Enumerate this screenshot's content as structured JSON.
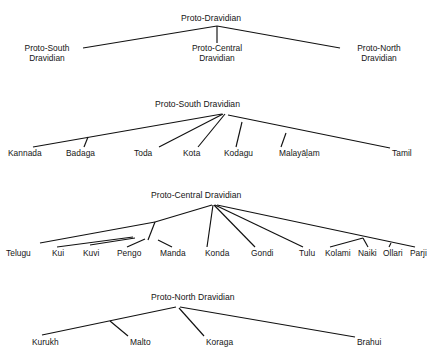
{
  "figure": {
    "background_color": "#ffffff",
    "line_color": "#111111",
    "text_color": "#151515",
    "caption_fragment": ""
  },
  "trees": [
    {
      "id": "proto-dravidian",
      "root": "Proto-Dravidian",
      "children": [
        {
          "label_line1": "Proto-South",
          "label_line2": "Dravidian"
        },
        {
          "label_line1": "Proto-Central",
          "label_line2": "Dravidian"
        },
        {
          "label_line1": "Proto-North",
          "label_line2": "Dravidian"
        }
      ]
    },
    {
      "id": "proto-south-dravidian",
      "root": "Proto-South Dravidian",
      "children": [
        {
          "label": "Kannada"
        },
        {
          "label": "Badaga"
        },
        {
          "label": "Toda"
        },
        {
          "label": "Kota"
        },
        {
          "label": "Kodagu"
        },
        {
          "label": "Malayāḷam"
        },
        {
          "label": "Tamil"
        }
      ]
    },
    {
      "id": "proto-central-dravidian",
      "root": "Proto-Central Dravidian",
      "children": [
        {
          "label": "Telugu"
        },
        {
          "label": "Kui"
        },
        {
          "label": "Kuvi"
        },
        {
          "label": "Pengo"
        },
        {
          "label": "Manda"
        },
        {
          "label": "Konda"
        },
        {
          "label": "Gondi"
        },
        {
          "label": "Tulu"
        },
        {
          "label": "Kolami"
        },
        {
          "label": "Naiki"
        },
        {
          "label": "Ollari"
        },
        {
          "label": "Parji"
        }
      ]
    },
    {
      "id": "proto-north-dravidian",
      "root": "Proto-North Dravidian",
      "children": [
        {
          "label": "Kurukh"
        },
        {
          "label": "Malto"
        },
        {
          "label": "Koraga"
        },
        {
          "label": "Brahui"
        }
      ]
    }
  ]
}
